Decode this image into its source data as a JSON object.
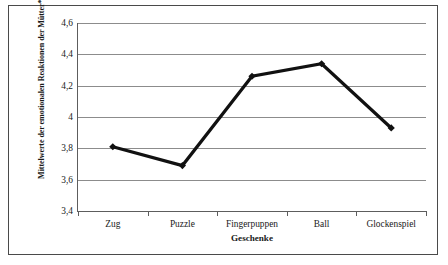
{
  "chart_data": {
    "type": "line",
    "title": "",
    "categories": [
      "Zug",
      "Puzzle",
      "Fingerpuppen",
      "Ball",
      "Glockenspiel"
    ],
    "values": [
      3.81,
      3.69,
      4.26,
      4.34,
      3.93
    ],
    "series": [
      {
        "name": "Mittelwerte der emotionalen Reaktionen der Mütter",
        "values": [
          3.81,
          3.69,
          4.26,
          4.34,
          3.93
        ]
      }
    ],
    "xlabel": "Geschenke",
    "ylabel": "Mittelwerte der emotionalen Reaktionen der Mütter*",
    "ylim": [
      3.4,
      4.6
    ],
    "ytick_step": 0.2,
    "ytick_labels": [
      "4,6",
      "4,4",
      "4,2",
      "4",
      "3,8",
      "3,6",
      "3,4"
    ],
    "ytick_values": [
      4.6,
      4.4,
      4.2,
      4.0,
      3.8,
      3.6,
      3.4
    ],
    "grid": true,
    "legend": "none",
    "decimal_separator": ",",
    "line_color": "#111111",
    "marker": "diamond",
    "marker_color": "#111111",
    "gridline_color": "#8c8c8c",
    "axis_color": "#5d5d5d",
    "background_color": "#ffffff",
    "border_color": "#4a4a4a"
  }
}
